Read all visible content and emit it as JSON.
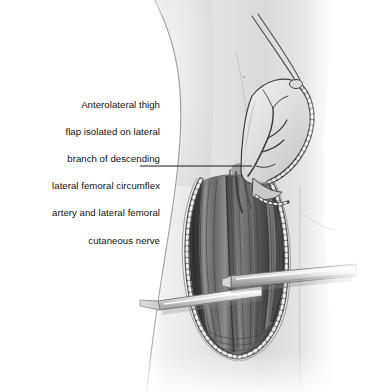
{
  "figure": {
    "name": "anterolateral-thigh-flap",
    "title": "Anterolateral thigh flap isolated on lateral branch of descending lateral femoral circumflex artery and lateral femoral cutaneous nerve",
    "medium": "grayscale medical line-and-wash illustration",
    "background_color": "#ffffff"
  },
  "annotation": {
    "lines": [
      "Anterolateral thigh",
      "flap isolated on lateral",
      "branch of descending",
      "lateral femoral circumflex",
      "artery and lateral femoral",
      "cutaneous nerve"
    ],
    "full_text": "Anterolateral thigh flap isolated on lateral branch of descending lateral femoral circumflex artery and lateral femoral cutaneous nerve",
    "align": "right",
    "text_color": "#111111"
  },
  "leader_line": {
    "name": "leader-line",
    "from_x": 140,
    "from_y": 166,
    "to_x": 252,
    "to_y": 166,
    "color": "#1a1a1a",
    "width": 1.1
  },
  "palette": {
    "skin_light": "#ededed",
    "skin_mid": "#dcdcdc",
    "skin_shadow": "#c2c2c2",
    "skin_deep_shadow": "#a8a8a8",
    "outline": "#3a3a3a",
    "muscle_dark": "#565656",
    "muscle_mid": "#6e6e6e",
    "muscle_light": "#9a9a9a",
    "wound_deep": "#3c3c3c",
    "fat_bead_fill": "#e8e8e8",
    "fat_bead_edge": "#4a4a4a",
    "metal_light": "#f2f2f2",
    "metal_mid": "#cdcdcd",
    "metal_dark": "#8e8e8e",
    "vessel": "#4a4a4a",
    "suture": "#555555"
  },
  "anatomy_labels": {
    "thigh": "lateral thigh",
    "flap": "elevated anterolateral thigh skin paddle",
    "flap_vessels": "branching perforator vessels on flap undersurface",
    "wound": "open longitudinal thigh wound",
    "muscle": "exposed vastus lateralis / rectus femoris muscle bellies",
    "pedicle": "vascular pedicle at leader line terminus",
    "wound_margin": "beaded subcutaneous fat margin",
    "suture": "two fine traction suture threads",
    "retractor_upper": "upper metallic retractor blade",
    "retractor_lower": "lower metallic retractor blade"
  },
  "elements": {
    "body_outline_name": "body-silhouette",
    "flap_name": "skin-paddle-flap",
    "wound_name": "surgical-wound",
    "muscle_name": "exposed-muscle",
    "retractor_upper_name": "retractor-upper",
    "retractor_lower_name": "retractor-lower",
    "suture_name": "suture-threads",
    "pedicle_name": "vascular-pedicle"
  }
}
